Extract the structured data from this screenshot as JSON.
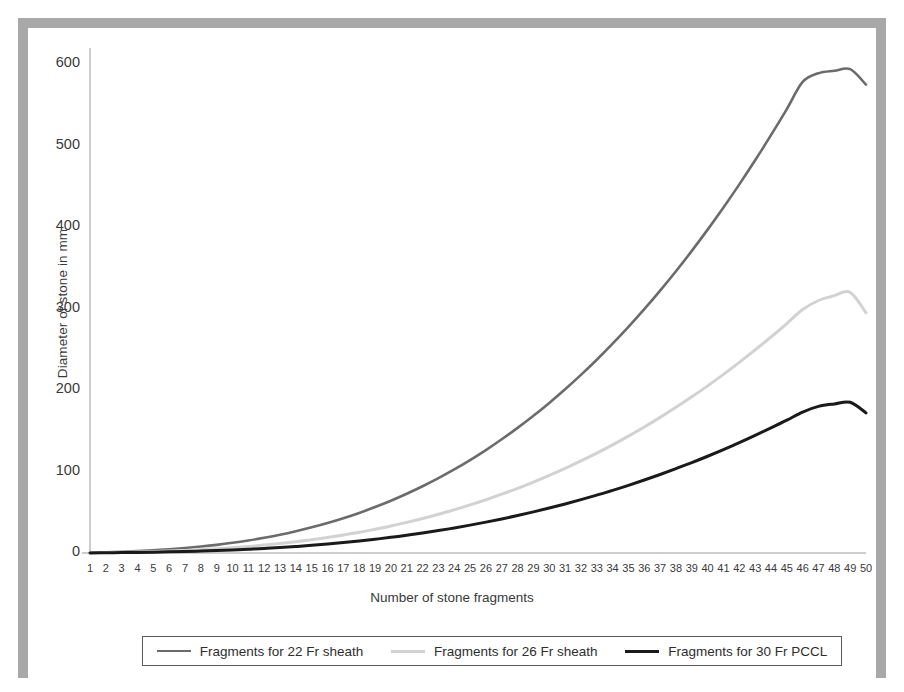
{
  "figure": {
    "background_color": "#ffffff",
    "border_color": "#a8a8a8"
  },
  "chart_data": {
    "type": "line",
    "title": "",
    "xlabel": "Number of stone fragments",
    "ylabel": "Diameter of stone in mm",
    "xlim": [
      1,
      50
    ],
    "ylim": [
      0,
      620
    ],
    "yticks": [
      0,
      100,
      200,
      300,
      400,
      500,
      600
    ],
    "ytick_labels": [
      "0",
      "100",
      "200",
      "300",
      "400",
      "500",
      "600"
    ],
    "xticks": [
      1,
      2,
      3,
      4,
      5,
      6,
      7,
      8,
      9,
      10,
      11,
      12,
      13,
      14,
      15,
      16,
      17,
      18,
      19,
      20,
      21,
      22,
      23,
      24,
      25,
      26,
      27,
      28,
      29,
      30,
      31,
      32,
      33,
      34,
      35,
      36,
      37,
      38,
      39,
      40,
      41,
      42,
      43,
      44,
      45,
      46,
      47,
      48,
      49,
      50
    ],
    "xtick_labels": [
      "1",
      "2",
      "3",
      "4",
      "5",
      "6",
      "7",
      "8",
      "9",
      "10",
      "11",
      "12",
      "13",
      "14",
      "15",
      "16",
      "17",
      "18",
      "19",
      "20",
      "21",
      "22",
      "23",
      "24",
      "25",
      "26",
      "27",
      "28",
      "29",
      "30",
      "31",
      "32",
      "33",
      "34",
      "35",
      "36",
      "37",
      "38",
      "39",
      "40",
      "41",
      "42",
      "43",
      "44",
      "45",
      "46",
      "47",
      "48",
      "49",
      "50"
    ],
    "grid": false,
    "legend_position": "below-axis",
    "x": [
      1,
      2,
      3,
      4,
      5,
      6,
      7,
      8,
      9,
      10,
      11,
      12,
      13,
      14,
      15,
      16,
      17,
      18,
      19,
      20,
      21,
      22,
      23,
      24,
      25,
      26,
      27,
      28,
      29,
      30,
      31,
      32,
      33,
      34,
      35,
      36,
      37,
      38,
      39,
      40,
      41,
      42,
      43,
      44,
      45,
      46,
      47,
      48,
      49,
      50
    ],
    "series": [
      {
        "name": "Fragments for 22 Fr sheath",
        "color": "#6b6b6b",
        "line_width": 2.6,
        "values": [
          0.5,
          1.0,
          1.6,
          2.4,
          3.4,
          4.6,
          6.1,
          7.9,
          10.0,
          12.5,
          15.4,
          18.7,
          22.4,
          26.7,
          31.5,
          36.8,
          42.7,
          49.2,
          56.4,
          64.2,
          72.7,
          81.9,
          91.9,
          102.6,
          114.1,
          126.4,
          139.6,
          153.6,
          168.5,
          184.3,
          201.0,
          218.7,
          237.3,
          257.0,
          277.6,
          299.3,
          322.1,
          345.9,
          370.9,
          397.0,
          424.2,
          452.6,
          482.2,
          513.0,
          545.0,
          578.3,
          589.0,
          592.0,
          594.0,
          575.0
        ]
      },
      {
        "name": "Fragments for 26 Fr sheath",
        "color": "#d2d2d2",
        "line_width": 3.0,
        "values": [
          0.3,
          0.5,
          0.9,
          1.3,
          1.8,
          2.4,
          3.2,
          4.1,
          5.2,
          6.5,
          8.0,
          9.7,
          11.6,
          13.8,
          16.3,
          19.0,
          22.1,
          25.4,
          29.2,
          33.2,
          37.6,
          42.4,
          47.5,
          53.1,
          59.0,
          65.4,
          72.2,
          79.4,
          87.1,
          95.3,
          103.9,
          113.1,
          122.7,
          132.8,
          143.5,
          154.7,
          166.5,
          178.8,
          191.7,
          205.2,
          219.3,
          234.0,
          249.3,
          265.2,
          281.7,
          298.9,
          310.0,
          316.0,
          320.0,
          295.0
        ]
      },
      {
        "name": "Fragments for 30 Fr PCCL",
        "color": "#1a1a1a",
        "line_width": 3.0,
        "values": [
          0.15,
          0.3,
          0.5,
          0.75,
          1.05,
          1.4,
          1.85,
          2.4,
          3.0,
          3.75,
          4.6,
          5.6,
          6.7,
          8.0,
          9.4,
          11.0,
          12.8,
          14.7,
          16.9,
          19.2,
          21.8,
          24.5,
          27.5,
          30.7,
          34.2,
          37.9,
          41.8,
          46.0,
          50.5,
          55.2,
          60.2,
          65.5,
          71.1,
          76.9,
          83.1,
          89.6,
          96.4,
          103.6,
          111.0,
          118.8,
          127.0,
          135.5,
          144.4,
          153.6,
          163.1,
          173.1,
          180.0,
          183.0,
          185.0,
          172.0
        ]
      }
    ]
  },
  "legend": {
    "entries": [
      {
        "label": "Fragments for 22 Fr sheath",
        "color": "#6b6b6b",
        "width": 2.6
      },
      {
        "label": "Fragments for 26 Fr sheath",
        "color": "#d2d2d2",
        "width": 3.0
      },
      {
        "label": "Fragments for 30 Fr PCCL",
        "color": "#1a1a1a",
        "width": 3.0
      }
    ]
  }
}
